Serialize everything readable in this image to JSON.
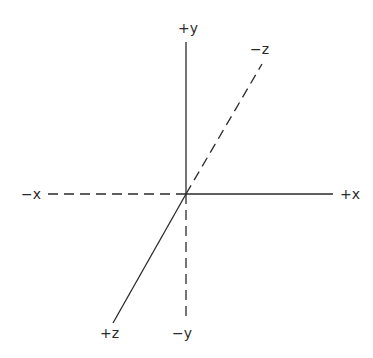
{
  "diagram": {
    "title": "",
    "type": "3D coordinate axes",
    "origin": {
      "x": 186,
      "y": 194
    },
    "axes": [
      {
        "name": "positive-x",
        "label": "+x",
        "style": "solid",
        "from": [
          186,
          194
        ],
        "to": [
          333,
          194
        ]
      },
      {
        "name": "negative-x",
        "label": "−x",
        "style": "dashed",
        "from": [
          48,
          194
        ],
        "to": [
          186,
          194
        ]
      },
      {
        "name": "positive-y",
        "label": "+y",
        "style": "solid",
        "from": [
          186,
          194
        ],
        "to": [
          186,
          42
        ]
      },
      {
        "name": "negative-y",
        "label": "−y",
        "style": "dashed",
        "from": [
          186,
          194
        ],
        "to": [
          186,
          322
        ]
      },
      {
        "name": "positive-z",
        "label": "+z",
        "style": "solid",
        "from": [
          186,
          194
        ],
        "to": [
          113,
          323
        ]
      },
      {
        "name": "negative-z",
        "label": "−z",
        "style": "dashed",
        "from": [
          186,
          194
        ],
        "to": [
          262,
          64
        ]
      }
    ],
    "labels": {
      "pos_x": "+x",
      "neg_x": "−x",
      "pos_y": "+y",
      "neg_y": "−y",
      "pos_z": "+z",
      "neg_z": "−z"
    },
    "colors": {
      "line": "#2a2a2a",
      "background": "#ffffff"
    }
  }
}
